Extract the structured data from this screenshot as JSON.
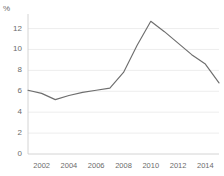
{
  "chart_data": {
    "type": "line",
    "title": "",
    "subtitle": "",
    "xlabel": "",
    "ylabel": "",
    "unit_label": "%",
    "grid": true,
    "legend": null,
    "legend_position": "none",
    "line_color": "#6e6e6e",
    "grid_color": "#e8e8e8",
    "axis_color": "#cfcfcf",
    "text_color": "#6b6b6b",
    "background": "#ffffff",
    "xlim": [
      2001,
      2015
    ],
    "ylim": [
      0,
      13.2
    ],
    "y_ticks": [
      0,
      2,
      4,
      6,
      8,
      10,
      12
    ],
    "y_tick_labels": [
      "0",
      "2",
      "4",
      "6",
      "8",
      "10",
      "12"
    ],
    "x_ticks": [
      2002,
      2004,
      2006,
      2008,
      2010,
      2012,
      2014
    ],
    "x_tick_labels": [
      "2002",
      "2004",
      "2006",
      "2008",
      "2010",
      "2012",
      "2014"
    ],
    "x": [
      2001,
      2002,
      2003,
      2004,
      2005,
      2006,
      2007,
      2008,
      2009,
      2010,
      2011,
      2012,
      2013,
      2014,
      2015
    ],
    "values": [
      6.1,
      5.8,
      5.2,
      5.6,
      5.9,
      6.1,
      6.3,
      7.8,
      10.4,
      12.7,
      11.7,
      10.6,
      9.5,
      8.6,
      6.8
    ],
    "series": [
      {
        "name": "",
        "values": [
          6.1,
          5.8,
          5.2,
          5.6,
          5.9,
          6.1,
          6.3,
          7.8,
          10.4,
          12.7,
          11.7,
          10.6,
          9.5,
          8.6,
          6.8
        ]
      }
    ]
  }
}
